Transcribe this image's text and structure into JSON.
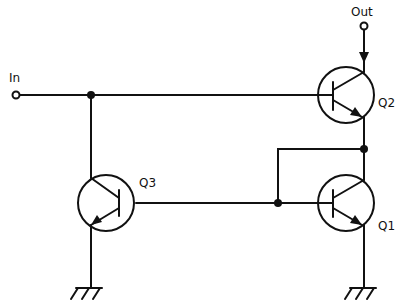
{
  "diagram": {
    "type": "circuit-schematic",
    "labels": {
      "input": "In",
      "output": "Out",
      "q1": "Q1",
      "q2": "Q2",
      "q3": "Q3"
    },
    "components": [
      {
        "id": "Q1",
        "kind": "NPN transistor",
        "position": "lower-right"
      },
      {
        "id": "Q2",
        "kind": "NPN transistor",
        "position": "upper-right"
      },
      {
        "id": "Q3",
        "kind": "PNP transistor",
        "position": "lower-left"
      }
    ],
    "connections": [
      "In -> Q2 base",
      "In -> Q3 collector",
      "Out -> Q2 collector",
      "Q2 emitter -> Q1 collector",
      "Q1 collector -> Q1 base (diode-connected)",
      "Q1 base -> Q3 base",
      "Q1 emitter -> ground",
      "Q3 emitter -> ground"
    ],
    "colors": {
      "line": "#111111",
      "background": "#ffffff"
    }
  }
}
